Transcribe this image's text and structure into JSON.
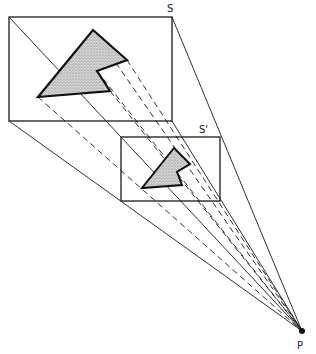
{
  "labels": {
    "plane_s": "S",
    "plane_s_prime": "S'",
    "point_p": "P"
  },
  "colors": {
    "stroke": "#1a1a1a",
    "fill": "#c9c9c9",
    "background": "#ffffff"
  },
  "figure": {
    "plane_s": {
      "x1": 9,
      "y1": 17,
      "x2": 172,
      "y2": 121
    },
    "plane_s_prime": {
      "x1": 121,
      "y1": 137,
      "x2": 220,
      "y2": 201
    },
    "projection_point": {
      "x": 302,
      "y": 331
    },
    "shape_large": [
      [
        93,
        30
      ],
      [
        127,
        60
      ],
      [
        97,
        71
      ],
      [
        110,
        91
      ],
      [
        38,
        97
      ]
    ],
    "shape_small": [
      [
        174,
        148
      ],
      [
        190,
        164
      ],
      [
        177,
        172
      ],
      [
        182,
        185
      ],
      [
        142,
        188
      ]
    ]
  }
}
